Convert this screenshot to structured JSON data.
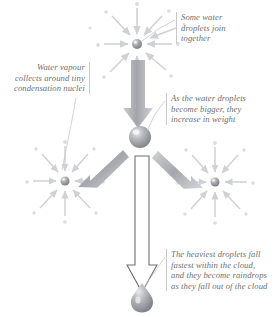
{
  "diagram": {
    "background_color": "#ffffff",
    "ink_color": "#6d6f73",
    "droplet_color": "#9a9ca1",
    "arrow_color": "#b4b6bb"
  },
  "annotations": {
    "top": "Some water\ndroplets join\ntogether",
    "left": "Water vapour\ncollects around tiny\ncondensation nuclei",
    "middle": "As the water droplets\nbecome bigger, they\nincrease in weight",
    "bottom": "The heaviest droplets fall\nfastest within the cloud,\nand they become raindrops\nas they fall out of the cloud"
  },
  "elements": {
    "top_cluster": {
      "name": "condensation-nucleus-top",
      "cx": 137,
      "cy": 44,
      "radius": 5
    },
    "left_cluster": {
      "name": "condensation-nucleus-left",
      "cx": 65,
      "cy": 181,
      "radius": 4.5
    },
    "right_cluster": {
      "name": "condensation-nucleus-right",
      "cx": 215,
      "cy": 182,
      "radius": 4.5
    },
    "middle_droplet": {
      "name": "merged-water-droplet",
      "cx": 140,
      "cy": 137,
      "radius": 11
    },
    "raindrop": {
      "name": "falling-raindrop",
      "cx": 142,
      "cy": 299,
      "radius": 11
    },
    "big_arrow_down": {
      "name": "arrow-droplets-descend",
      "from_y": 62,
      "to_y": 126
    },
    "arrow_left_up": {
      "name": "arrow-left-nucleus-to-droplet"
    },
    "arrow_right_up": {
      "name": "arrow-right-nucleus-to-droplet"
    },
    "hollow_arrow": {
      "name": "arrow-raindrop-falls-out",
      "from_y": 157,
      "to_y": 292
    }
  }
}
